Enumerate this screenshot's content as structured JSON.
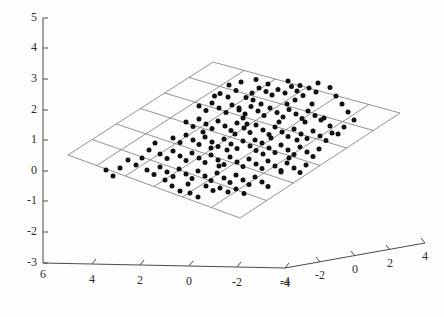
{
  "figure": {
    "title": "",
    "background_color": "#fdfdfc",
    "axis_color": "#4a4a4a",
    "grid_color": "#777777",
    "marker_color": "#111111"
  },
  "chart_data": {
    "type": "scatter",
    "title": "",
    "xlabel": "",
    "ylabel": "",
    "zlabel": "",
    "projection": "3d",
    "grid": true,
    "legend": null,
    "xlim": [
      -4,
      6
    ],
    "ylim": [
      -4,
      4
    ],
    "zlim": [
      -3,
      5
    ],
    "x_ticks": [
      6,
      4,
      2,
      0,
      -2,
      -4
    ],
    "y_ticks": [
      -4,
      -2,
      0,
      2,
      4
    ],
    "z_ticks": [
      5,
      4,
      3,
      2,
      1,
      0,
      -1,
      -2,
      -3
    ],
    "x_tick_labels": [
      "6",
      "4",
      "2",
      "0",
      "-2",
      "-4"
    ],
    "y_tick_labels": [
      "-4",
      "-2",
      "0",
      "2",
      "4"
    ],
    "z_tick_labels": [
      "5",
      "4",
      "3",
      "2",
      "1",
      "0",
      "-1",
      "-2",
      "-3"
    ],
    "plane_grid_cells": [
      6,
      6
    ],
    "n_points": 181,
    "points": [
      [
        214.5,
        96.0
      ],
      [
        220.0,
        93.5
      ],
      [
        228.0,
        97.0
      ],
      [
        236.0,
        90.5
      ],
      [
        246.0,
        97.5
      ],
      [
        252.0,
        93.0
      ],
      [
        259.0,
        88.0
      ],
      [
        266.0,
        91.5
      ],
      [
        272.0,
        95.0
      ],
      [
        278.0,
        89.5
      ],
      [
        285.0,
        93.0
      ],
      [
        291.5,
        86.5
      ],
      [
        297.0,
        91.0
      ],
      [
        303.0,
        95.5
      ],
      [
        309.0,
        88.0
      ],
      [
        316.0,
        92.0
      ],
      [
        199.0,
        106.0
      ],
      [
        206.0,
        110.5
      ],
      [
        212.0,
        103.0
      ],
      [
        219.0,
        108.0
      ],
      [
        226.0,
        112.5
      ],
      [
        232.0,
        105.0
      ],
      [
        239.0,
        110.0
      ],
      [
        245.0,
        114.0
      ],
      [
        251.0,
        106.5
      ],
      [
        258.0,
        111.0
      ],
      [
        264.0,
        115.5
      ],
      [
        270.0,
        108.0
      ],
      [
        277.0,
        112.5
      ],
      [
        283.0,
        117.0
      ],
      [
        289.0,
        109.5
      ],
      [
        296.0,
        114.0
      ],
      [
        302.0,
        118.5
      ],
      [
        308.0,
        111.0
      ],
      [
        315.0,
        115.5
      ],
      [
        321.0,
        120.0
      ],
      [
        186.0,
        122.0
      ],
      [
        193.0,
        126.5
      ],
      [
        199.0,
        119.0
      ],
      [
        206.0,
        124.0
      ],
      [
        212.0,
        128.5
      ],
      [
        218.0,
        121.0
      ],
      [
        225.0,
        126.0
      ],
      [
        231.0,
        130.5
      ],
      [
        237.0,
        123.0
      ],
      [
        244.0,
        128.0
      ],
      [
        250.0,
        132.5
      ],
      [
        256.0,
        125.0
      ],
      [
        263.0,
        130.0
      ],
      [
        269.0,
        134.5
      ],
      [
        275.0,
        127.0
      ],
      [
        282.0,
        132.0
      ],
      [
        288.0,
        136.5
      ],
      [
        294.0,
        129.0
      ],
      [
        301.0,
        134.0
      ],
      [
        307.0,
        138.5
      ],
      [
        313.0,
        131.0
      ],
      [
        320.0,
        136.0
      ],
      [
        326.0,
        140.5
      ],
      [
        332.0,
        133.0
      ],
      [
        173.0,
        138.0
      ],
      [
        180.0,
        142.5
      ],
      [
        186.0,
        135.0
      ],
      [
        193.0,
        140.0
      ],
      [
        199.0,
        144.5
      ],
      [
        205.0,
        137.0
      ],
      [
        212.0,
        142.0
      ],
      [
        218.0,
        146.5
      ],
      [
        224.0,
        139.0
      ],
      [
        231.0,
        144.0
      ],
      [
        237.0,
        148.5
      ],
      [
        243.0,
        141.0
      ],
      [
        250.0,
        146.0
      ],
      [
        256.0,
        150.5
      ],
      [
        262.0,
        143.0
      ],
      [
        269.0,
        148.0
      ],
      [
        275.0,
        152.5
      ],
      [
        281.0,
        145.0
      ],
      [
        288.0,
        150.0
      ],
      [
        294.0,
        154.5
      ],
      [
        300.0,
        147.0
      ],
      [
        307.0,
        152.0
      ],
      [
        313.0,
        156.5
      ],
      [
        319.0,
        149.0
      ],
      [
        160.0,
        154.0
      ],
      [
        167.0,
        158.5
      ],
      [
        173.0,
        151.0
      ],
      [
        180.0,
        156.0
      ],
      [
        186.0,
        160.5
      ],
      [
        192.0,
        153.0
      ],
      [
        199.0,
        158.0
      ],
      [
        205.0,
        162.5
      ],
      [
        211.0,
        155.0
      ],
      [
        218.0,
        160.0
      ],
      [
        224.0,
        164.5
      ],
      [
        230.0,
        157.0
      ],
      [
        237.0,
        162.0
      ],
      [
        243.0,
        166.5
      ],
      [
        249.0,
        159.0
      ],
      [
        256.0,
        164.0
      ],
      [
        262.0,
        168.5
      ],
      [
        268.0,
        161.0
      ],
      [
        275.0,
        166.0
      ],
      [
        281.0,
        170.5
      ],
      [
        287.0,
        163.0
      ],
      [
        294.0,
        168.0
      ],
      [
        300.0,
        172.5
      ],
      [
        306.0,
        165.0
      ],
      [
        147.0,
        170.0
      ],
      [
        154.0,
        174.5
      ],
      [
        160.0,
        167.0
      ],
      [
        167.0,
        172.0
      ],
      [
        173.0,
        176.5
      ],
      [
        179.0,
        169.0
      ],
      [
        186.0,
        174.0
      ],
      [
        192.0,
        178.5
      ],
      [
        198.0,
        171.0
      ],
      [
        205.0,
        176.0
      ],
      [
        211.0,
        180.5
      ],
      [
        217.0,
        173.0
      ],
      [
        224.0,
        178.0
      ],
      [
        230.0,
        182.5
      ],
      [
        236.0,
        175.0
      ],
      [
        243.0,
        180.0
      ],
      [
        249.0,
        184.5
      ],
      [
        255.0,
        177.0
      ],
      [
        262.0,
        182.0
      ],
      [
        268.0,
        186.5
      ],
      [
        206.0,
        186.0
      ],
      [
        213.0,
        190.5
      ],
      [
        220.0,
        188.0
      ],
      [
        228.0,
        192.0
      ],
      [
        236.0,
        189.0
      ],
      [
        244.0,
        193.5
      ],
      [
        190.0,
        193.0
      ],
      [
        198.0,
        197.0
      ],
      [
        229.0,
        85.0
      ],
      [
        241.0,
        82.0
      ],
      [
        256.0,
        79.5
      ],
      [
        268.0,
        84.0
      ],
      [
        288.0,
        81.0
      ],
      [
        300.0,
        85.5
      ],
      [
        318.0,
        83.0
      ],
      [
        330.0,
        87.5
      ],
      [
        336.0,
        96.0
      ],
      [
        342.0,
        104.0
      ],
      [
        348.0,
        112.0
      ],
      [
        354.0,
        120.0
      ],
      [
        344.0,
        127.0
      ],
      [
        338.0,
        134.0
      ],
      [
        330.0,
        126.0
      ],
      [
        324.0,
        118.0
      ],
      [
        155.0,
        143.0
      ],
      [
        149.0,
        150.0
      ],
      [
        142.0,
        158.0
      ],
      [
        136.0,
        165.0
      ],
      [
        128.0,
        160.0
      ],
      [
        120.0,
        168.0
      ],
      [
        113.0,
        176.0
      ],
      [
        106.0,
        170.0
      ],
      [
        165.0,
        180.0
      ],
      [
        172.0,
        186.0
      ],
      [
        180.0,
        191.0
      ],
      [
        188.0,
        184.0
      ],
      [
        253.0,
        100.0
      ],
      [
        261.0,
        104.0
      ],
      [
        243.0,
        118.0
      ],
      [
        235.0,
        134.0
      ],
      [
        227.0,
        150.0
      ],
      [
        219.0,
        166.0
      ],
      [
        211.0,
        148.0
      ],
      [
        203.0,
        132.0
      ],
      [
        295.0,
        100.0
      ],
      [
        287.0,
        104.0
      ],
      [
        279.0,
        122.0
      ],
      [
        271.0,
        138.0
      ],
      [
        263.0,
        154.0
      ],
      [
        255.0,
        140.0
      ],
      [
        247.0,
        124.0
      ],
      [
        239.0,
        108.0
      ],
      [
        312.0,
        104.0
      ],
      [
        305.0,
        122.0
      ],
      [
        297.0,
        140.0
      ],
      [
        289.0,
        158.0
      ],
      [
        281.0,
        172.0
      ]
    ]
  },
  "geometry": {
    "z_axis": {
      "x": 43,
      "y_top": 18,
      "y_bottom": 263
    },
    "origin_corner": {
      "x": 285,
      "y": 268
    },
    "x_axis_end": {
      "x": 43,
      "y": 263
    },
    "y_axis_end": {
      "x": 425,
      "y": 243
    },
    "plane": {
      "top": [
        213,
        62
      ],
      "left": [
        68,
        155
      ],
      "bottom": [
        240,
        218
      ],
      "right": [
        400,
        113
      ]
    }
  },
  "axes": {
    "z": {
      "name": "z-axis",
      "ticks": [
        {
          "label": "5",
          "y": 18
        },
        {
          "label": "4",
          "y": 48
        },
        {
          "label": "3",
          "y": 79
        },
        {
          "label": "2",
          "y": 110
        },
        {
          "label": "1",
          "y": 140
        },
        {
          "label": "0",
          "y": 171
        },
        {
          "label": "-1",
          "y": 201
        },
        {
          "label": "-2",
          "y": 232
        },
        {
          "label": "-3",
          "y": 263
        }
      ]
    },
    "x": {
      "name": "x-axis",
      "ticks": [
        {
          "label": "6",
          "x": 43,
          "y": 263
        },
        {
          "label": "4",
          "x": 92,
          "y": 264
        },
        {
          "label": "2",
          "x": 140,
          "y": 265
        },
        {
          "label": "0",
          "x": 189,
          "y": 266
        },
        {
          "label": "-2",
          "x": 237,
          "y": 267
        },
        {
          "label": "-4",
          "x": 285,
          "y": 268
        }
      ]
    },
    "y": {
      "name": "y-axis",
      "ticks": [
        {
          "label": "-4",
          "x": 285,
          "y": 268
        },
        {
          "label": "-2",
          "x": 320,
          "y": 262
        },
        {
          "label": "0",
          "x": 355,
          "y": 256
        },
        {
          "label": "2",
          "x": 390,
          "y": 250
        },
        {
          "label": "4",
          "x": 425,
          "y": 243
        }
      ]
    }
  }
}
